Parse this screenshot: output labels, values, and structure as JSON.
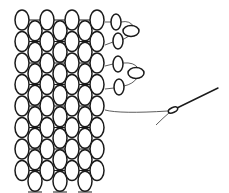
{
  "figure": {
    "colors": {
      "background": "#ffffff",
      "stroke": "#1a1a1a",
      "thread": "#333333"
    }
  },
  "grid": {
    "columns_top": [
      22,
      47,
      72,
      97
    ],
    "columns_offset": [
      35,
      60,
      85
    ],
    "row_top": 20,
    "row_pitch": 21.5,
    "rows_top_cols": 8,
    "rows_offset_cols": 8,
    "bead_rx": 7,
    "bead_ry": 10
  },
  "edge_beads": [
    {
      "cx": 116,
      "cy": 22,
      "rx": 5,
      "ry": 8
    },
    {
      "cx": 131,
      "cy": 31,
      "rx": 8,
      "ry": 5.5
    },
    {
      "cx": 118,
      "cy": 41,
      "rx": 5,
      "ry": 8
    },
    {
      "cx": 118,
      "cy": 64,
      "rx": 5,
      "ry": 8
    },
    {
      "cx": 136,
      "cy": 73,
      "rx": 8,
      "ry": 5.5
    },
    {
      "cx": 119,
      "cy": 87,
      "rx": 5,
      "ry": 8
    }
  ],
  "needle": {
    "eye": {
      "cx": 173,
      "cy": 110,
      "rx": 5,
      "ry": 2.5
    },
    "tip": {
      "x": 218,
      "y": 88
    }
  }
}
